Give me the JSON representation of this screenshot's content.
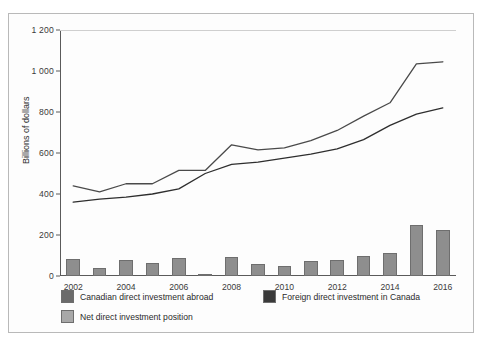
{
  "figure": {
    "ylabel": "Billions of dollars"
  },
  "chart_data": {
    "type": "bar",
    "title": "",
    "subtitle": "",
    "xlabel": "",
    "ylabel": "Billions of dollars",
    "ylim": [
      0,
      1200
    ],
    "yticks": [
      0,
      200,
      400,
      600,
      800,
      1000,
      1200
    ],
    "ytick_labels": [
      "0",
      "200",
      "400",
      "600",
      "800",
      "1 000",
      "1 200"
    ],
    "grid": false,
    "legend_position": "below-axes",
    "categories": [
      "2002",
      "2003",
      "2004",
      "2005",
      "2006",
      "2007",
      "2008",
      "2009",
      "2010",
      "2011",
      "2012",
      "2013",
      "2014",
      "2015",
      "2016"
    ],
    "xtick_labels": [
      "2002",
      "2004",
      "2006",
      "2008",
      "2010",
      "2012",
      "2014",
      "2016"
    ],
    "x": [
      2002,
      2003,
      2004,
      2005,
      2006,
      2007,
      2008,
      2009,
      2010,
      2011,
      2012,
      2013,
      2014,
      2015,
      2016
    ],
    "series": [
      {
        "name": "Canadian direct investment abroad",
        "type": "line",
        "color": "#4a4a4a",
        "values": [
          440,
          410,
          450,
          450,
          515,
          515,
          640,
          615,
          625,
          660,
          710,
          780,
          845,
          1035,
          1045
        ]
      },
      {
        "name": "Foreign direct investment in Canada",
        "type": "line",
        "color": "#2e2e2e",
        "values": [
          360,
          375,
          385,
          400,
          425,
          500,
          545,
          555,
          575,
          595,
          620,
          665,
          735,
          790,
          820
        ]
      },
      {
        "name": "Net direct investment position",
        "type": "bar",
        "color": "#8e8e8e",
        "values": [
          85,
          40,
          80,
          65,
          90,
          10,
          95,
          60,
          50,
          75,
          80,
          100,
          110,
          250,
          225
        ]
      }
    ]
  },
  "legend": {
    "items": [
      {
        "label": "Canadian direct investment abroad",
        "color": "#6b6b6b"
      },
      {
        "label": "Foreign direct investment in Canada",
        "color": "#3a3a3a"
      },
      {
        "label": "Net direct investment position",
        "color": "#a8a8a8"
      }
    ]
  }
}
